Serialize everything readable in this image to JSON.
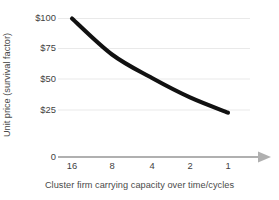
{
  "chart_data": {
    "type": "line",
    "title": "",
    "subtitle": "",
    "xlabel": "Cluster firm carrying capacity over time/cycles",
    "ylabel": "Unit price (survival factor)",
    "x_tick_labels": [
      "16",
      "8",
      "4",
      "2",
      "1"
    ],
    "x_values": [
      16,
      8,
      4,
      2,
      1
    ],
    "y_tick_labels": [
      "$100",
      "$75",
      "$50",
      "$25",
      "0"
    ],
    "y_tick_values": [
      100,
      75,
      50,
      25,
      0
    ],
    "ylim": [
      0,
      100
    ],
    "grid": "horizontal",
    "legend": "none",
    "series": [
      {
        "name": "Unit price",
        "color": "#111111",
        "values": [
          100,
          74,
          57,
          43,
          32
        ]
      }
    ],
    "annotations": [],
    "axis_arrow": "right",
    "grid_color": "#e9e9e9",
    "axis_color": "#b0b0b0",
    "text_color": "#3f3f3f"
  }
}
